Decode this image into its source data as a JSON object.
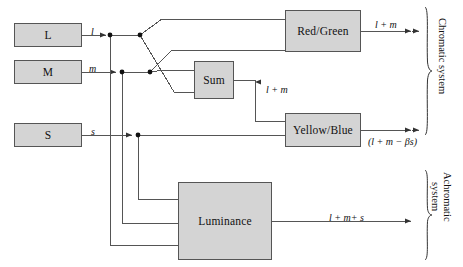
{
  "figure": {
    "background_color": "#ffffff",
    "box_fill": "#d4d4d4",
    "box_stroke": "#555555",
    "wire_color": "#555555"
  },
  "boxes": {
    "cone_l": {
      "label": "L",
      "x": 14,
      "y": 23,
      "w": 68,
      "h": 24
    },
    "cone_m": {
      "label": "M",
      "x": 14,
      "y": 60,
      "w": 68,
      "h": 24
    },
    "cone_s": {
      "label": "S",
      "x": 14,
      "y": 123,
      "w": 68,
      "h": 24
    },
    "sum": {
      "label": "Sum",
      "x": 194,
      "y": 61,
      "w": 40,
      "h": 38
    },
    "red_green": {
      "label": "Red/Green",
      "x": 285,
      "y": 10,
      "w": 76,
      "h": 42
    },
    "yellow_blue": {
      "label": "Yellow/Blue",
      "x": 285,
      "y": 113,
      "w": 76,
      "h": 34
    },
    "luminance": {
      "label": "Luminance",
      "x": 178,
      "y": 182,
      "w": 94,
      "h": 78
    }
  },
  "edge_labels": {
    "l_signal": {
      "text": "l",
      "x": 91,
      "y": 27
    },
    "m_signal": {
      "text": "m",
      "x": 89,
      "y": 64
    },
    "s_signal": {
      "text": "s",
      "x": 91,
      "y": 127
    },
    "sum_out": {
      "text": "l + m",
      "x": 266,
      "y": 85
    },
    "red_green_out": {
      "text": "l + m",
      "x": 375,
      "y": 20
    },
    "yellow_blue_out": {
      "text": "(l + m − βs)",
      "x": 368,
      "y": 137
    },
    "luminance_out": {
      "text": "l + m+ s",
      "x": 329,
      "y": 213
    }
  },
  "group_labels": {
    "chromatic": {
      "text": "Chromatic system",
      "x": 447,
      "y": 18
    },
    "achromatic_line1": {
      "text": "Achromatic",
      "x": 452,
      "y": 172
    },
    "achromatic_line2": {
      "text": "system",
      "x": 440,
      "y": 182
    }
  },
  "braces": {
    "chromatic": {
      "x": 424,
      "y": 7,
      "height": 128
    },
    "achromatic": {
      "x": 424,
      "y": 170,
      "height": 90
    }
  },
  "wire_geometry": {
    "row_l_y": 35,
    "row_m_y": 72,
    "row_s_y": 135,
    "tap_l_x": 110,
    "tap_m_x": 122,
    "tap_s_x": 138,
    "fan_l_x": 140,
    "fan_m_x": 150,
    "lum_in_s_y": 199,
    "lum_in_m_y": 223,
    "lum_in_l_y": 245,
    "lum_out_y": 221,
    "sum_drop_x": 255,
    "sum_drop_y": 121,
    "rg_in_top_y": 19,
    "rg_in_bot_y": 50,
    "sum_in_top_y": 70,
    "sum_in_bot_y": 92,
    "arrow_tip_x": 411
  },
  "icons": {
    "junction": "junction-dot",
    "arrowhead": "arrowhead-triangle",
    "brace_right": "curly-brace-right"
  }
}
